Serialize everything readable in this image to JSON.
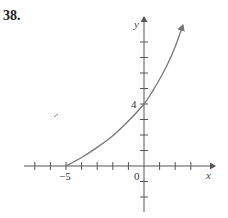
{
  "problem": {
    "number": "38."
  },
  "chart_data": {
    "type": "line",
    "title": "",
    "xlabel": "x",
    "ylabel": "y",
    "xlim": [
      -8,
      4.5
    ],
    "ylim": [
      -3,
      9.5
    ],
    "x_ticks": [
      -7,
      -6,
      -5,
      -4,
      -3,
      -2,
      -1,
      1,
      2,
      3
    ],
    "y_ticks": [
      -2,
      -1,
      1,
      2,
      3,
      4,
      5,
      6,
      7,
      8
    ],
    "labeled_ticks": {
      "x": [
        "-5",
        "0"
      ],
      "y": [
        "4"
      ]
    },
    "grid": false,
    "legend": null,
    "series": [
      {
        "name": "curve",
        "color": "#777777",
        "arrow_end": true,
        "points": [
          [
            -5,
            0
          ],
          [
            -4,
            0.55
          ],
          [
            -3,
            1.2
          ],
          [
            -2,
            1.95
          ],
          [
            -1,
            2.9
          ],
          [
            0,
            4
          ],
          [
            0.5,
            4.75
          ],
          [
            1,
            5.6
          ],
          [
            1.5,
            6.55
          ],
          [
            2,
            7.7
          ],
          [
            2.5,
            9.1
          ]
        ]
      }
    ],
    "annotations": [
      {
        "text": "-5",
        "x": -5,
        "y": 0,
        "position": "below"
      },
      {
        "text": "0",
        "x": 0,
        "y": 0,
        "position": "below-left"
      },
      {
        "text": "4",
        "x": 0,
        "y": 4,
        "position": "left"
      }
    ]
  },
  "labels": {
    "x_axis": "x",
    "y_axis": "y",
    "tick_neg5": "−5",
    "tick_0": "0",
    "tick_4": "4"
  }
}
